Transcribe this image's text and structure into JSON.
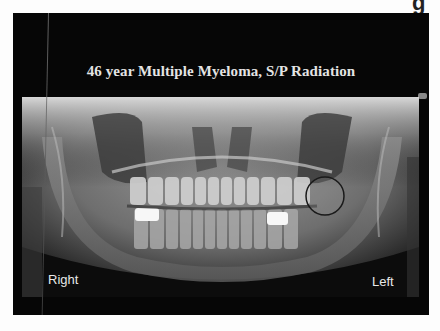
{
  "page": {
    "corner_glyph": "g"
  },
  "slide": {
    "title": "46 year Multiple Myeloma, S/P Radiation",
    "image": {
      "type": "panoramic-dental-radiograph",
      "labels": {
        "right": "Right",
        "left": "Left"
      },
      "annotation": "circle-highlight-left-posterior-mandible"
    }
  },
  "colors": {
    "slide_background": "#060606",
    "title_text": "#e4e4e4",
    "page_background": "#fdfdfd",
    "label_text": "#e8e8e8"
  }
}
